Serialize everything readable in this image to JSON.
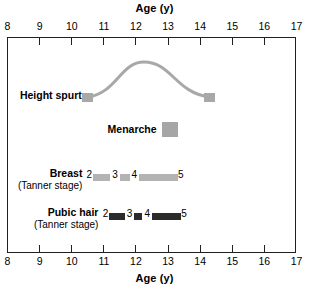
{
  "chart_data": {
    "type": "table",
    "title": "Age (y)",
    "xlabel": "Age (y)",
    "ylabel": "",
    "xlim": [
      8,
      17
    ],
    "xticks": [
      8,
      9,
      10,
      11,
      12,
      13,
      14,
      15,
      16,
      17
    ],
    "xtick_labels": [
      "8",
      "9",
      "10",
      "11",
      "12",
      "13",
      "14",
      "15",
      "16",
      "17"
    ],
    "grid": false,
    "legend": "none",
    "axis_title_top": "Age (y)",
    "axis_title_bottom": "Age (y)",
    "rows": [
      {
        "label": "Height spurt",
        "sublabel": "",
        "kind": "curve",
        "start_age": 10.5,
        "end_age": 14.3,
        "peak_age": 12.25,
        "color": "#a8a8a8"
      },
      {
        "label": "Menarche",
        "sublabel": "",
        "kind": "marker",
        "start_age": 12.8,
        "end_age": 13.3,
        "color": "#a6a6a6"
      },
      {
        "label": "Breast",
        "sublabel": "(Tanner stage)",
        "kind": "stage-bar",
        "color": "#b3b3b3",
        "start_age": 10.5,
        "end_age": 13.3,
        "stages": [
          {
            "number": "2",
            "age": 10.55
          },
          {
            "number": "3",
            "age": 11.35
          },
          {
            "number": "4",
            "age": 11.95
          },
          {
            "number": "5",
            "age": 13.4
          }
        ],
        "segments": [
          {
            "from": 10.65,
            "to": 11.2
          },
          {
            "from": 11.5,
            "to": 11.8
          },
          {
            "from": 12.1,
            "to": 13.3
          }
        ]
      },
      {
        "label": "Pubic hair",
        "sublabel": "(Tanner stage)",
        "kind": "stage-bar",
        "color": "#2b2b2b",
        "start_age": 11.0,
        "end_age": 13.4,
        "stages": [
          {
            "number": "2",
            "age": 11.05
          },
          {
            "number": "3",
            "age": 11.8
          },
          {
            "number": "4",
            "age": 12.35
          },
          {
            "number": "5",
            "age": 13.5
          }
        ],
        "segments": [
          {
            "from": 11.15,
            "to": 11.65
          },
          {
            "from": 11.95,
            "to": 12.2
          },
          {
            "from": 12.5,
            "to": 13.4
          }
        ]
      }
    ]
  },
  "colors": {
    "frame": "#231f20",
    "spurt": "#a8a8a8",
    "menarche": "#a6a6a6",
    "breast": "#b3b3b3",
    "pubic": "#2b2b2b",
    "background": "#ffffff"
  }
}
